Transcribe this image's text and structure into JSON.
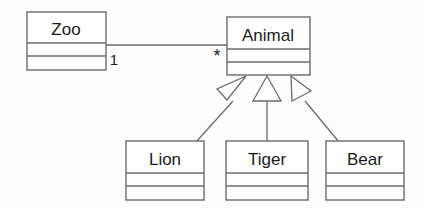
{
  "diagram": {
    "type": "uml-class-diagram",
    "background_color": "#fdfdfd",
    "line_color": "#6b6b6b",
    "text_color": "#1a1a1a",
    "classes": [
      {
        "id": "zoo",
        "name": "Zoo",
        "x": 27,
        "y": 12,
        "width": 79,
        "height": 58,
        "name_divider_y": 43,
        "attr_divider_y": 56
      },
      {
        "id": "animal",
        "name": "Animal",
        "x": 227,
        "y": 17,
        "width": 83,
        "height": 58,
        "name_divider_y": 49,
        "attr_divider_y": 62
      },
      {
        "id": "lion",
        "name": "Lion",
        "x": 126,
        "y": 141,
        "width": 78,
        "height": 59,
        "name_divider_y": 173,
        "attr_divider_y": 186
      },
      {
        "id": "tiger",
        "name": "Tiger",
        "x": 226,
        "y": 141,
        "width": 82,
        "height": 59,
        "name_divider_y": 173,
        "attr_divider_y": 186
      },
      {
        "id": "bear",
        "name": "Bear",
        "x": 326,
        "y": 141,
        "width": 78,
        "height": 59,
        "name_divider_y": 173,
        "attr_divider_y": 186
      }
    ],
    "association": {
      "from": "zoo",
      "to": "animal",
      "source_multiplicity": "1",
      "target_multiplicity": "*",
      "line": {
        "x1": 106,
        "y1": 45,
        "x2": 227,
        "y2": 45
      },
      "source_label_pos": {
        "x": 114,
        "y": 65
      },
      "target_label_pos": {
        "x": 217,
        "y": 62
      }
    },
    "generalizations": [
      {
        "from": "lion",
        "to": "animal",
        "label": "Lion inherits Animal"
      },
      {
        "from": "tiger",
        "to": "animal",
        "label": "Tiger inherits Animal"
      },
      {
        "from": "bear",
        "to": "animal",
        "label": "Bear inherits Animal"
      }
    ]
  }
}
